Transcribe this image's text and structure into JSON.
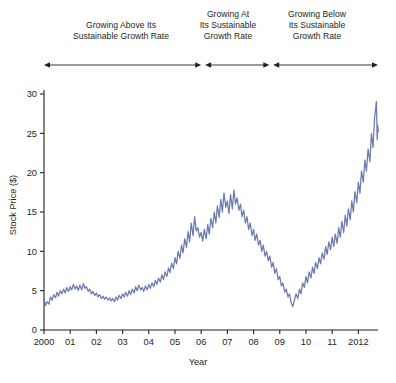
{
  "annotations": [
    {
      "id": "ann-growing-above",
      "text": "Growing Above Its\nSustainable Growth Rate",
      "line1": "Growing Above Its",
      "line2": "Sustainable Growth Rate"
    },
    {
      "id": "ann-growing-at",
      "text": "Growing At\nIts Sustainable\nGrowth Rate",
      "line1": "Growing At",
      "line2": "Its Sustainable",
      "line3": "Growth Rate"
    },
    {
      "id": "ann-growing-below",
      "text": "Growing Below\nIts Sustainable\nGrowth Rate",
      "line1": "Growing Below",
      "line2": "Its Sustainable",
      "line3": "Growth Rate"
    }
  ],
  "colors": {
    "line": "#6b7ab0",
    "axis": "#231f20",
    "arrow": "#231f20",
    "text": "#231f20",
    "background": "#ffffff"
  },
  "chart_data": {
    "type": "line",
    "title": "",
    "xlabel": "Year",
    "ylabel": "Stock Price ($)",
    "xlim": [
      2000,
      2012.75
    ],
    "ylim": [
      0,
      30
    ],
    "yticks": [
      0,
      5,
      10,
      15,
      20,
      25,
      30
    ],
    "yticklabels": [
      "0",
      "5",
      "10",
      "15",
      "20",
      "25",
      "30"
    ],
    "xticks": [
      2000,
      2001,
      2002,
      2003,
      2004,
      2005,
      2006,
      2007,
      2008,
      2009,
      2010,
      2011,
      2012
    ],
    "xticklabels": [
      "2000",
      "01",
      "02",
      "03",
      "04",
      "05",
      "06",
      "07",
      "08",
      "09",
      "10",
      "11",
      "2012"
    ],
    "grid": false,
    "legend": null,
    "series": [
      {
        "name": "Stock Price",
        "color": "#6b7ab0",
        "x": [
          2000.0,
          2000.06,
          2000.12,
          2000.19,
          2000.25,
          2000.31,
          2000.37,
          2000.44,
          2000.5,
          2000.56,
          2000.62,
          2000.69,
          2000.75,
          2000.81,
          2000.87,
          2000.94,
          2001.0,
          2001.06,
          2001.12,
          2001.19,
          2001.25,
          2001.31,
          2001.37,
          2001.44,
          2001.5,
          2001.56,
          2001.62,
          2001.69,
          2001.75,
          2001.81,
          2001.87,
          2001.94,
          2002.0,
          2002.06,
          2002.12,
          2002.19,
          2002.25,
          2002.31,
          2002.37,
          2002.44,
          2002.5,
          2002.56,
          2002.62,
          2002.69,
          2002.75,
          2002.81,
          2002.87,
          2002.94,
          2003.0,
          2003.06,
          2003.12,
          2003.19,
          2003.25,
          2003.31,
          2003.37,
          2003.44,
          2003.5,
          2003.56,
          2003.62,
          2003.69,
          2003.75,
          2003.81,
          2003.87,
          2003.94,
          2004.0,
          2004.06,
          2004.12,
          2004.19,
          2004.25,
          2004.31,
          2004.37,
          2004.44,
          2004.5,
          2004.56,
          2004.62,
          2004.69,
          2004.75,
          2004.81,
          2004.87,
          2004.94,
          2005.0,
          2005.06,
          2005.12,
          2005.19,
          2005.25,
          2005.31,
          2005.37,
          2005.44,
          2005.5,
          2005.56,
          2005.62,
          2005.69,
          2005.75,
          2005.81,
          2005.87,
          2005.94,
          2006.0,
          2006.06,
          2006.12,
          2006.19,
          2006.25,
          2006.31,
          2006.37,
          2006.44,
          2006.5,
          2006.56,
          2006.62,
          2006.69,
          2006.75,
          2006.81,
          2006.87,
          2006.94,
          2007.0,
          2007.06,
          2007.12,
          2007.19,
          2007.25,
          2007.31,
          2007.37,
          2007.44,
          2007.5,
          2007.56,
          2007.62,
          2007.69,
          2007.75,
          2007.81,
          2007.87,
          2007.94,
          2008.0,
          2008.06,
          2008.12,
          2008.19,
          2008.25,
          2008.31,
          2008.37,
          2008.44,
          2008.5,
          2008.56,
          2008.62,
          2008.69,
          2008.75,
          2008.81,
          2008.87,
          2008.94,
          2009.0,
          2009.06,
          2009.12,
          2009.19,
          2009.25,
          2009.31,
          2009.37,
          2009.44,
          2009.5,
          2009.56,
          2009.62,
          2009.69,
          2009.75,
          2009.81,
          2009.87,
          2009.94,
          2010.0,
          2010.06,
          2010.12,
          2010.19,
          2010.25,
          2010.31,
          2010.37,
          2010.44,
          2010.5,
          2010.56,
          2010.62,
          2010.69,
          2010.75,
          2010.81,
          2010.87,
          2010.94,
          2011.0,
          2011.06,
          2011.12,
          2011.19,
          2011.25,
          2011.31,
          2011.37,
          2011.44,
          2011.5,
          2011.56,
          2011.62,
          2011.69,
          2011.75,
          2011.81,
          2011.87,
          2011.94,
          2012.0,
          2012.06,
          2012.12,
          2012.19,
          2012.25,
          2012.31,
          2012.37,
          2012.44,
          2012.5,
          2012.56,
          2012.62,
          2012.69
        ],
        "values": [
          4.0,
          3.1,
          3.6,
          3.3,
          4.2,
          3.8,
          4.5,
          4.1,
          4.8,
          4.3,
          5.0,
          4.6,
          5.2,
          4.7,
          5.4,
          4.9,
          5.5,
          5.1,
          5.8,
          5.2,
          5.6,
          5.0,
          5.7,
          5.1,
          5.9,
          5.3,
          5.5,
          4.9,
          5.2,
          4.6,
          4.9,
          4.4,
          4.7,
          4.2,
          4.5,
          4.0,
          4.3,
          3.9,
          4.2,
          3.8,
          4.1,
          3.7,
          4.0,
          3.6,
          4.2,
          3.8,
          4.4,
          4.0,
          4.6,
          4.2,
          4.8,
          4.3,
          5.0,
          4.5,
          5.2,
          4.7,
          5.5,
          5.0,
          5.7,
          5.1,
          5.4,
          4.9,
          5.6,
          5.1,
          5.8,
          5.3,
          6.0,
          5.5,
          6.3,
          5.8,
          6.6,
          6.1,
          7.0,
          6.4,
          7.4,
          6.8,
          7.9,
          7.3,
          8.5,
          7.8,
          9.2,
          8.4,
          10.0,
          9.1,
          10.8,
          9.8,
          11.6,
          10.5,
          12.5,
          11.2,
          13.6,
          12.0,
          14.4,
          12.6,
          13.0,
          11.8,
          12.4,
          11.3,
          12.8,
          11.6,
          13.4,
          12.2,
          14.2,
          13.0,
          15.0,
          13.6,
          15.8,
          14.3,
          16.6,
          15.0,
          17.4,
          15.6,
          16.4,
          14.8,
          17.2,
          15.4,
          17.8,
          16.0,
          16.8,
          15.2,
          16.0,
          14.4,
          15.2,
          13.6,
          14.4,
          12.8,
          13.6,
          12.0,
          12.8,
          11.4,
          12.2,
          10.8,
          11.4,
          10.0,
          10.8,
          9.4,
          10.0,
          8.8,
          9.4,
          8.0,
          8.6,
          7.2,
          7.8,
          6.4,
          6.8,
          5.6,
          6.0,
          4.8,
          5.2,
          4.2,
          4.6,
          3.4,
          3.0,
          3.8,
          4.6,
          4.0,
          5.2,
          4.6,
          6.0,
          5.4,
          6.8,
          6.0,
          7.4,
          6.6,
          8.0,
          7.2,
          8.6,
          7.8,
          9.2,
          8.4,
          9.8,
          9.0,
          10.6,
          9.6,
          11.2,
          10.2,
          11.8,
          10.6,
          12.2,
          11.0,
          13.0,
          11.8,
          13.8,
          12.4,
          14.6,
          13.2,
          15.4,
          14.0,
          16.4,
          15.0,
          17.6,
          16.2,
          18.8,
          17.4,
          20.2,
          18.8,
          21.6,
          20.2,
          23.0,
          21.4,
          25.0,
          23.2,
          27.0,
          29.0
        ]
      },
      {
        "name": "Stock Price (tail)",
        "color": "#6b7ab0",
        "x": [
          2012.69,
          2012.72,
          2012.74,
          2012.76
        ],
        "values": [
          29.0,
          24.2,
          26.0,
          25.2
        ]
      }
    ]
  },
  "arrows": [
    {
      "id": "arrow-growing-above",
      "start_year": 2000.0,
      "end_year": 2006.0,
      "both_ends": true
    },
    {
      "id": "arrow-growing-at",
      "start_year": 2006.15,
      "end_year": 2008.6,
      "both_ends": true
    },
    {
      "id": "arrow-growing-below",
      "start_year": 2008.75,
      "end_year": 2012.75,
      "both_ends": true
    }
  ]
}
